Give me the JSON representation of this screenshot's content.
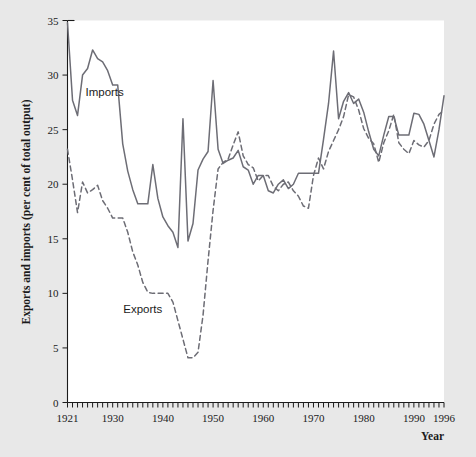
{
  "chart_data": {
    "type": "line",
    "title": "",
    "xlabel": "Year",
    "ylabel": "Exports and imports (per cent of total output)",
    "xlim": [
      1921,
      1996
    ],
    "ylim": [
      0,
      35
    ],
    "ytick_values": [
      0,
      5,
      10,
      15,
      20,
      25,
      30,
      35
    ],
    "ytick_labels": [
      "0",
      "5",
      "10",
      "15",
      "20",
      "25",
      "30",
      "35"
    ],
    "xtick_values": [
      1921,
      1930,
      1940,
      1950,
      1960,
      1970,
      1980,
      1990,
      1996
    ],
    "xtick_labels": [
      "1921",
      "1930",
      "1940",
      "1950",
      "1960",
      "1970",
      "1980",
      "1990",
      "1996"
    ],
    "xtick_minor_step": 1,
    "grid": false,
    "legend_position": "inline-annotations",
    "x": [
      1921,
      1922,
      1923,
      1924,
      1925,
      1926,
      1927,
      1928,
      1929,
      1930,
      1931,
      1932,
      1933,
      1934,
      1935,
      1936,
      1937,
      1938,
      1939,
      1940,
      1941,
      1942,
      1943,
      1944,
      1945,
      1946,
      1947,
      1948,
      1949,
      1950,
      1951,
      1952,
      1953,
      1954,
      1955,
      1956,
      1957,
      1958,
      1959,
      1960,
      1961,
      1962,
      1963,
      1964,
      1965,
      1966,
      1967,
      1968,
      1969,
      1970,
      1971,
      1972,
      1973,
      1974,
      1975,
      1976,
      1977,
      1978,
      1979,
      1980,
      1981,
      1982,
      1983,
      1984,
      1985,
      1986,
      1987,
      1988,
      1989,
      1990,
      1991,
      1992,
      1993,
      1994,
      1995,
      1996
    ],
    "series": [
      {
        "name": "Imports",
        "style": "solid",
        "color": "#6d6d75",
        "label_x": 1928.4,
        "label_y": 28.1,
        "values": [
          34.8,
          27.7,
          26.3,
          30.0,
          30.6,
          32.3,
          31.5,
          31.2,
          30.4,
          29.1,
          29.1,
          23.7,
          21.2,
          19.5,
          18.2,
          18.2,
          18.2,
          21.8,
          18.7,
          17.0,
          16.2,
          15.6,
          14.2,
          26.0,
          14.8,
          16.4,
          21.3,
          22.3,
          23.0,
          29.5,
          23.2,
          21.9,
          22.2,
          22.4,
          23.1,
          21.6,
          21.3,
          20.0,
          20.8,
          20.8,
          19.4,
          19.2,
          20.0,
          20.4,
          19.6,
          20.0,
          21.0,
          21.0,
          21.0,
          21.0,
          21.0,
          24.1,
          27.4,
          32.2,
          26.0,
          27.6,
          28.4,
          27.4,
          27.8,
          26.6,
          24.8,
          23.2,
          22.6,
          24.5,
          26.2,
          26.2,
          24.5,
          24.5,
          24.5,
          26.5,
          26.4,
          25.5,
          24.0,
          22.5,
          25.0,
          28.1
        ]
      },
      {
        "name": "Exports",
        "style": "dashed",
        "color": "#6d6d75",
        "label_x": 1936.0,
        "label_y": 8.2,
        "values": [
          23.2,
          20.4,
          17.4,
          20.2,
          19.2,
          19.5,
          19.9,
          18.5,
          17.8,
          16.9,
          16.9,
          16.9,
          15.6,
          13.8,
          12.6,
          11.0,
          10.1,
          10.0,
          10.0,
          10.0,
          10.0,
          9.2,
          7.5,
          5.8,
          4.1,
          4.1,
          4.6,
          8.0,
          13.0,
          17.6,
          21.4,
          22.0,
          22.3,
          23.6,
          24.8,
          22.6,
          21.8,
          21.5,
          20.3,
          20.8,
          20.8,
          19.8,
          19.4,
          20.0,
          20.2,
          19.4,
          18.9,
          18.0,
          17.8,
          20.8,
          22.4,
          21.4,
          23.0,
          24.0,
          25.0,
          26.2,
          28.2,
          28.0,
          26.8,
          25.1,
          24.2,
          23.7,
          22.0,
          23.8,
          24.9,
          26.4,
          23.8,
          23.2,
          22.8,
          24.0,
          23.6,
          23.4,
          24.0,
          25.5,
          26.4,
          26.8
        ]
      }
    ]
  },
  "figure": {
    "background_color": "#e8e8e8",
    "plot_background_color": "#ffffff",
    "axis_color": "#1b1b1b",
    "line_color": "#6d6d75"
  }
}
